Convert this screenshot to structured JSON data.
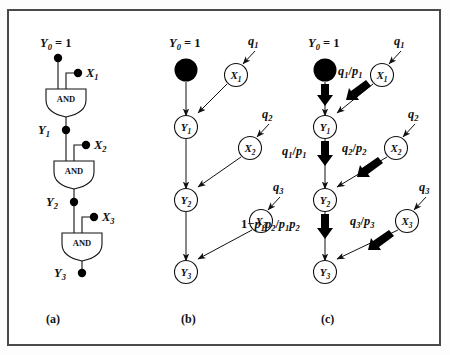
{
  "figure": {
    "caption_a": "(a)",
    "caption_b": "(b)",
    "caption_c": "(c)"
  },
  "panel_a": {
    "name": "and-gate-ladder",
    "top_label": "Y0 = 1",
    "gate_label": "AND",
    "gates": [
      "AND",
      "AND",
      "AND"
    ],
    "y_nodes": [
      "Y0 = 1",
      "Y1",
      "Y2",
      "Y3"
    ],
    "x_inputs": [
      "X1",
      "X2",
      "X3"
    ]
  },
  "panel_b": {
    "name": "bayesian-network",
    "top_label": "Y0 = 1",
    "y_nodes": [
      "Y1",
      "Y2",
      "Y3"
    ],
    "x_nodes": [
      "X1",
      "X2",
      "X3"
    ],
    "q_labels": [
      "q1",
      "q2",
      "q3"
    ]
  },
  "panel_c": {
    "name": "weighted-bayesian-network",
    "top_label": "Y0 = 1",
    "y_nodes": [
      "Y1",
      "Y2",
      "Y3"
    ],
    "x_nodes": [
      "X1",
      "X2",
      "X3"
    ],
    "q_labels": [
      "q1",
      "q2",
      "q3"
    ],
    "diag_weights": [
      "q1/p1",
      "q2/p2",
      "q3/p3"
    ],
    "vert_weights": [
      "",
      "q1/p1",
      "1-p1p2/p1p2"
    ]
  },
  "colors": {
    "ink": "#111111",
    "frame": "#4a4a4a",
    "page": "#ffffff"
  }
}
